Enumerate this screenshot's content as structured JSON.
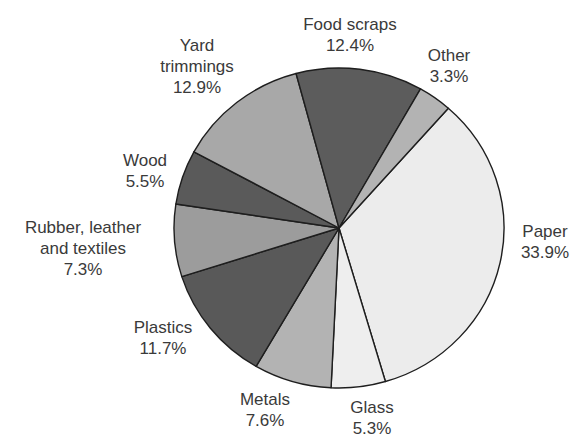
{
  "chart_data": {
    "type": "pie",
    "title": "",
    "start_angle_deg": -48.5,
    "direction": "clockwise",
    "center": [
      339,
      228
    ],
    "radius": [
      165,
      160
    ],
    "slices": [
      {
        "label": "Paper",
        "value": 33.9,
        "color": "#ececec"
      },
      {
        "label": "Glass",
        "value": 5.3,
        "color": "#eeeeee"
      },
      {
        "label": "Metals",
        "value": 7.6,
        "color": "#b3b3b3"
      },
      {
        "label": "Plastics",
        "value": 11.7,
        "color": "#595959"
      },
      {
        "label": "Rubber, leather and textiles",
        "value": 7.3,
        "color": "#9c9c9c"
      },
      {
        "label": "Wood",
        "value": 5.5,
        "color": "#5a5a5a"
      },
      {
        "label": "Yard trimmings",
        "value": 12.9,
        "color": "#a8a8a8"
      },
      {
        "label": "Food scraps",
        "value": 12.4,
        "color": "#5c5c5c"
      },
      {
        "label": "Other",
        "value": 3.3,
        "color": "#b3b3b3"
      }
    ]
  },
  "labels": {
    "food": {
      "line1": "Food scraps",
      "line2": "12.4%"
    },
    "other": {
      "line1": "Other",
      "line2": "3.3%"
    },
    "yard": {
      "line1": "Yard",
      "line2": "trimmings",
      "line3": "12.9%"
    },
    "wood": {
      "line1": "Wood",
      "line2": "5.5%"
    },
    "rubber": {
      "line1": "Rubber, leather",
      "line2": "and textiles",
      "line3": "7.3%"
    },
    "plastics": {
      "line1": "Plastics",
      "line2": "11.7%"
    },
    "metals": {
      "line1": "Metals",
      "line2": "7.6%"
    },
    "glass": {
      "line1": "Glass",
      "line2": "5.3%"
    },
    "paper": {
      "line1": "Paper",
      "line2": "33.9%"
    }
  }
}
